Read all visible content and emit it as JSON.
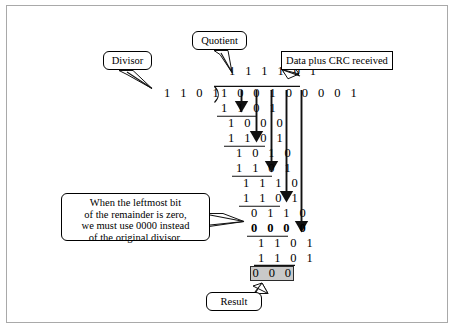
{
  "figure": {
    "title_alt": "CRC division at the receiver",
    "labels": {
      "divisor": "Divisor",
      "quotient": "Quotient",
      "data_plus_crc": "Data plus CRC received",
      "result": "Result",
      "note_line1": "When the leftmost bit",
      "note_line2": "of the remainder is zero,",
      "note_line3": "we must use 0000 instead",
      "note_line4": "of the original divisor."
    },
    "division": {
      "quotient_digits": "1 1 1 1 0 1",
      "divisor_digits": "1 1 0 1",
      "dividend_digits": "1 0 0 1 0 0 0 0 1",
      "steps": [
        {
          "subtrahend": "1 1 0 1",
          "remainder": "1 0 0 0"
        },
        {
          "subtrahend": "1 1 0 1",
          "remainder": "1 0 1 0"
        },
        {
          "subtrahend": "1 1 0 1",
          "remainder": "1 1 1 0"
        },
        {
          "subtrahend": "1 1 0 1",
          "remainder": "0 1 1 0"
        },
        {
          "subtrahend": "0 0 0 0",
          "remainder": "1 1 0 1",
          "bold": true
        },
        {
          "subtrahend": "1 1 0 1",
          "remainder": "0 0 0"
        }
      ],
      "final_remainder": "0 0 0"
    },
    "colors": {
      "ink": "#000000",
      "frame": "#a9a9a9",
      "result_fill": "#c9c9c9",
      "result_border": "#2b2b2b"
    }
  }
}
